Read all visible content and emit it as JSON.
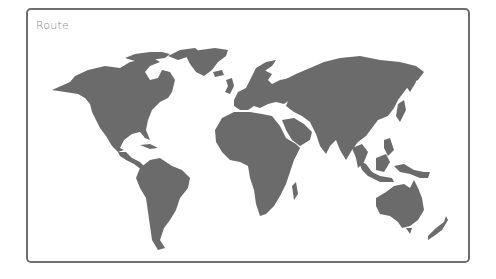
{
  "panel": {
    "title": "Route"
  },
  "map": {
    "land_color": "#6b6b6b",
    "border_color": "#6e6e6e",
    "background": "#ffffff",
    "regions": [
      "north-america",
      "greenland",
      "south-america",
      "europe",
      "africa",
      "asia",
      "southeast-asia",
      "australia",
      "new-zealand",
      "japan",
      "uk",
      "madagascar",
      "iceland"
    ]
  }
}
